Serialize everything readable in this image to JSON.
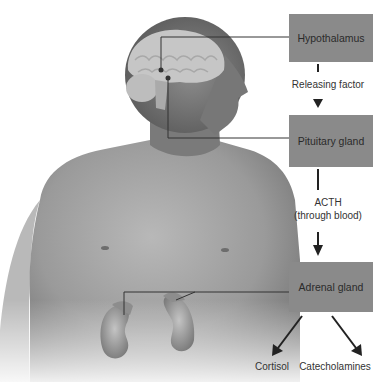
{
  "diagram": {
    "boxes": {
      "hypothalamus": "Hypothalamus",
      "pituitary": "Pituitary gland",
      "adrenal": "Adrenal gland"
    },
    "arrows": {
      "hyp_to_pit": "Releasing factor",
      "pit_to_adr_line1": "ACTH",
      "pit_to_adr_line2": "(through blood)"
    },
    "outputs": {
      "left": "Cortisol",
      "right": "Catecholamines"
    },
    "colors": {
      "box_fill": "#8a8a8a",
      "box_text": "#2a2a2a",
      "arrow": "#222222",
      "body": "#8c8c8c"
    }
  }
}
